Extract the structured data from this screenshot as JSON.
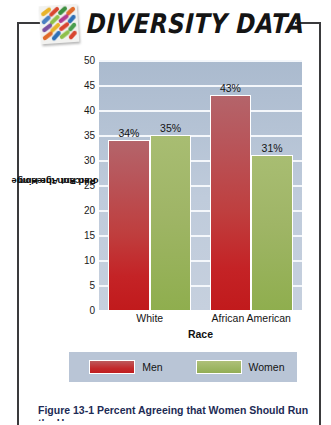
{
  "header": {
    "title": "DIVERSITY DATA",
    "logo_icon": "mosaic-tiles-icon"
  },
  "caption": {
    "text": "Figure 13-1   Percent Agreeing that Women Should Run the Home"
  },
  "legend": {
    "items": [
      {
        "label": "Men",
        "color": "#c32a2c"
      },
      {
        "label": "Women",
        "color": "#9cb563"
      }
    ]
  },
  "chart_data": {
    "type": "bar",
    "title": "",
    "categories": [
      "White",
      "African American"
    ],
    "series": [
      {
        "name": "Men",
        "values": [
          34,
          43
        ],
        "color": "#c32a2c",
        "labels": [
          "34%",
          "43%"
        ]
      },
      {
        "name": "Women",
        "values": [
          35,
          31
        ],
        "color": "#9cb563",
        "labels": [
          "35%",
          "31%"
        ]
      }
    ],
    "xlabel": "Race",
    "ylabel": "Percent Agreeing Women Should Run the Home",
    "ylabel_line1": "Percent Agreeing",
    "ylabel_line2": "Women Should Run the Home",
    "ylim": [
      0,
      50
    ],
    "yticks": [
      0,
      5,
      10,
      15,
      20,
      25,
      30,
      35,
      40,
      45,
      50
    ],
    "ytick_labels": [
      "0",
      "5",
      "10",
      "15",
      "20",
      "25",
      "30",
      "35",
      "40",
      "45",
      "50"
    ],
    "grid": true,
    "legend_position": "bottom",
    "plot_background": "#bcc8d8",
    "gridline_color": "#f4f7fb"
  }
}
